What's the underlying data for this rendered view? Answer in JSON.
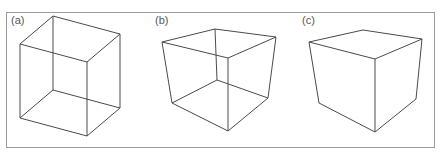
{
  "figure": {
    "panels": [
      {
        "label": "(a)",
        "type": "wireframe cube (Necker cube)",
        "all_edges_visible": true
      },
      {
        "label": "(b)",
        "type": "wireframe cube (perspective)",
        "all_edges_visible": true
      },
      {
        "label": "(c)",
        "type": "solid cube (hidden edges removed)",
        "all_edges_visible": false
      }
    ],
    "colors": {
      "stroke": "#4a4a4a",
      "border": "#9a9a9a",
      "label": "#555555",
      "background": "#ffffff"
    }
  }
}
